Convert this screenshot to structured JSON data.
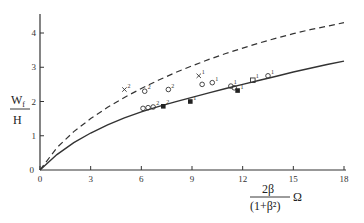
{
  "chart_data": {
    "type": "line",
    "title": "",
    "xlabel": "2β/(1+β²) Ω",
    "xlabel_parts": {
      "numerator": "2β",
      "denominator": "(1+β²)",
      "suffix": "Ω"
    },
    "ylabel": "Wf/H",
    "ylabel_parts": {
      "numerator": "W",
      "subscript": "f",
      "denominator": "H"
    },
    "xlim": [
      0,
      18
    ],
    "ylim": [
      0,
      4.5
    ],
    "x_ticks": [
      "0",
      "3",
      "6",
      "9",
      "12",
      "15",
      "18"
    ],
    "y_ticks": [
      "0",
      "1",
      "2",
      "3",
      "4"
    ],
    "grid": false,
    "legend": null,
    "series": [
      {
        "name": "solid curve",
        "style": "solid",
        "x": [
          0,
          1,
          2,
          3,
          4,
          5,
          6,
          7,
          8,
          9,
          10,
          11,
          12,
          13,
          14,
          15,
          16,
          17,
          18
        ],
        "y": [
          0,
          0.45,
          0.8,
          1.08,
          1.32,
          1.52,
          1.7,
          1.85,
          1.99,
          2.12,
          2.25,
          2.38,
          2.5,
          2.62,
          2.74,
          2.86,
          2.97,
          3.08,
          3.18
        ]
      },
      {
        "name": "dashed curve",
        "style": "dashed",
        "x": [
          0,
          1,
          2,
          3,
          4,
          5,
          6,
          7,
          8,
          9,
          10,
          11,
          12,
          13,
          14,
          15,
          16,
          17,
          18
        ],
        "y": [
          0,
          0.65,
          1.12,
          1.5,
          1.83,
          2.12,
          2.38,
          2.62,
          2.84,
          3.04,
          3.23,
          3.4,
          3.56,
          3.71,
          3.85,
          3.98,
          4.1,
          4.2,
          4.3
        ]
      }
    ],
    "markers": [
      {
        "shape": "x",
        "x": 5.0,
        "y": 2.35,
        "label": "2"
      },
      {
        "shape": "o",
        "x": 6.2,
        "y": 2.3,
        "label": "2"
      },
      {
        "shape": "o",
        "x": 6.1,
        "y": 1.8,
        "label": ""
      },
      {
        "shape": "o",
        "x": 6.4,
        "y": 1.82,
        "label": ""
      },
      {
        "shape": "o",
        "x": 6.7,
        "y": 1.84,
        "label": "2"
      },
      {
        "shape": "square-filled",
        "x": 7.3,
        "y": 1.86,
        "label": "2"
      },
      {
        "shape": "o",
        "x": 7.6,
        "y": 2.35,
        "label": "2"
      },
      {
        "shape": "x",
        "x": 9.4,
        "y": 2.75,
        "label": "1"
      },
      {
        "shape": "o",
        "x": 9.6,
        "y": 2.5,
        "label": ""
      },
      {
        "shape": "o",
        "x": 10.2,
        "y": 2.55,
        "label": "1"
      },
      {
        "shape": "square-filled",
        "x": 8.9,
        "y": 2.0,
        "label": "1"
      },
      {
        "shape": "o",
        "x": 11.3,
        "y": 2.45,
        "label": "1"
      },
      {
        "shape": "o",
        "x": 11.5,
        "y": 2.4,
        "label": ""
      },
      {
        "shape": "square-filled",
        "x": 11.7,
        "y": 2.32,
        "label": "1"
      },
      {
        "shape": "square-open",
        "x": 12.6,
        "y": 2.62,
        "label": "1"
      },
      {
        "shape": "o",
        "x": 13.5,
        "y": 2.75,
        "label": "1"
      }
    ],
    "colors": {
      "line": "#333333",
      "axis": "#333333",
      "background": "#ffffff"
    }
  }
}
